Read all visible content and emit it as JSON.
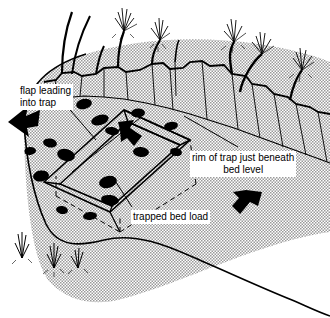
{
  "figure": {
    "domain": "diagram",
    "view": "oblique block diagram",
    "background_color": "#ffffff",
    "line_color": "#000000",
    "stipple_color": "#cfcfcf",
    "pebble_color": "#000000"
  },
  "labels": {
    "flap": {
      "line1": "flap leading",
      "line2": "into trap",
      "x": 18,
      "y": 84
    },
    "rim": {
      "line1": "rim of trap just beneath",
      "line2": "bed level",
      "x": 190,
      "y": 151
    },
    "trapped": {
      "line1": "trapped bed load",
      "x": 131,
      "y": 210
    }
  },
  "annotations": {
    "flow_arrow_left": "solid black arrow pointing left",
    "flow_arrow_into_trap": "solid black arrow pointing down-right into trap mouth",
    "flow_arrow_right": "solid black arrow pointing down-left on right bed",
    "dashed_outline": "buried trap body shown with dashed lines",
    "bank_top": "vegetated bank top with grass tufts and stems",
    "grass_below": "grass tufts below front edge of block"
  }
}
